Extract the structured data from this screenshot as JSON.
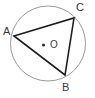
{
  "figure": {
    "background_color": "#ffffff",
    "width": 95,
    "height": 98
  },
  "circle": {
    "name": "circumscribed-circle",
    "center_x": 48,
    "center_y": 43.5,
    "radius": 37.5,
    "stroke_color": "#9a9a9a",
    "stroke_width": 1,
    "fill": "none"
  },
  "center_point": {
    "label": "O",
    "dot_x": 43.5,
    "dot_y": 45,
    "dot_radius": 1.6,
    "dot_color": "#333333",
    "label_x": 50,
    "label_y": 47.5
  },
  "triangle": {
    "name": "inscribed-triangle-ABC",
    "stroke_color": "#1e1e1e",
    "stroke_width": 1.6,
    "fill": "none",
    "points": "14,36 74,18 65,75",
    "vertices": [
      {
        "id": "A",
        "label": "A",
        "x": 14,
        "y": 36,
        "label_x": 3,
        "label_y": 35
      },
      {
        "id": "C",
        "label": "C",
        "x": 74,
        "y": 18,
        "label_x": 76,
        "label_y": 11
      },
      {
        "id": "B",
        "label": "B",
        "x": 65,
        "y": 75,
        "label_x": 62,
        "label_y": 91
      }
    ]
  },
  "chart_data": {
    "type": "diagram",
    "elements": [
      {
        "kind": "circle",
        "label": "O",
        "center": [
          48,
          43.5
        ],
        "radius": 37.5
      },
      {
        "kind": "point",
        "label": "O",
        "position": [
          43.5,
          45
        ]
      },
      {
        "kind": "point",
        "label": "A",
        "position": [
          14,
          36
        ]
      },
      {
        "kind": "point",
        "label": "B",
        "position": [
          65,
          75
        ]
      },
      {
        "kind": "point",
        "label": "C",
        "position": [
          74,
          18
        ]
      },
      {
        "kind": "segment",
        "label": "AC",
        "from": [
          14,
          36
        ],
        "to": [
          74,
          18
        ]
      },
      {
        "kind": "segment",
        "label": "CB",
        "from": [
          74,
          18
        ],
        "to": [
          65,
          75
        ]
      },
      {
        "kind": "segment",
        "label": "BA",
        "from": [
          65,
          75
        ],
        "to": [
          14,
          36
        ]
      }
    ]
  }
}
